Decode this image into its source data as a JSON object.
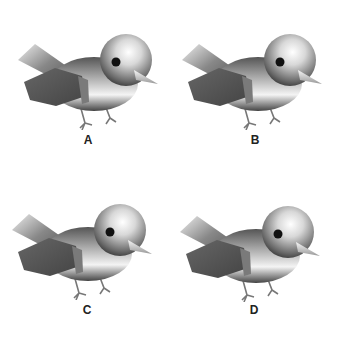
{
  "figures": [
    {
      "label": "A",
      "bird": {
        "head_tilt": 0,
        "beak_angle": 8
      }
    },
    {
      "label": "B",
      "bird": {
        "head_tilt": 0,
        "beak_angle": 12
      }
    },
    {
      "label": "C",
      "bird": {
        "head_tilt": 0,
        "beak_angle": 10
      }
    },
    {
      "label": "D",
      "bird": {
        "head_tilt": 0,
        "beak_angle": 18
      }
    }
  ],
  "colors": {
    "background": "#ffffff",
    "label": "#222222",
    "wing": "#555555"
  }
}
